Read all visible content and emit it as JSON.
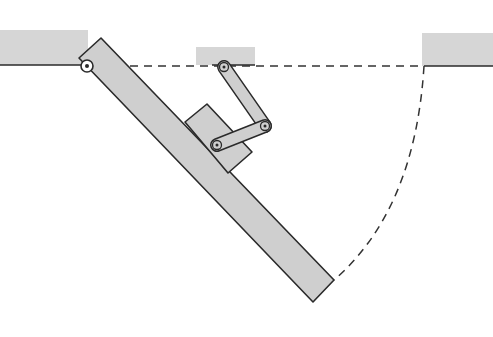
{
  "figure": {
    "colors": {
      "fill": "#cfcfcf",
      "ceiling_fill": "#d6d6d6",
      "stroke": "#2a2a2a",
      "dash": "#333333",
      "background": "#ffffff"
    }
  },
  "parts": {
    "ceiling_left": {
      "x": 0,
      "y": 30,
      "w": 88,
      "h": 35
    },
    "ceiling_middle": {
      "x": 196,
      "y": 47,
      "w": 59,
      "h": 18
    },
    "ceiling_right": {
      "x": 422,
      "y": 33,
      "w": 71,
      "h": 33
    },
    "main_pivot": {
      "cx": 87,
      "cy": 66
    },
    "link_pivot_top": {
      "cx": 224,
      "cy": 67
    },
    "link_joint_middle": {
      "cx": 265,
      "cy": 126
    },
    "link_joint_block": {
      "cx": 217,
      "cy": 145
    },
    "swing_end": {
      "x": 334,
      "y": 280
    }
  }
}
